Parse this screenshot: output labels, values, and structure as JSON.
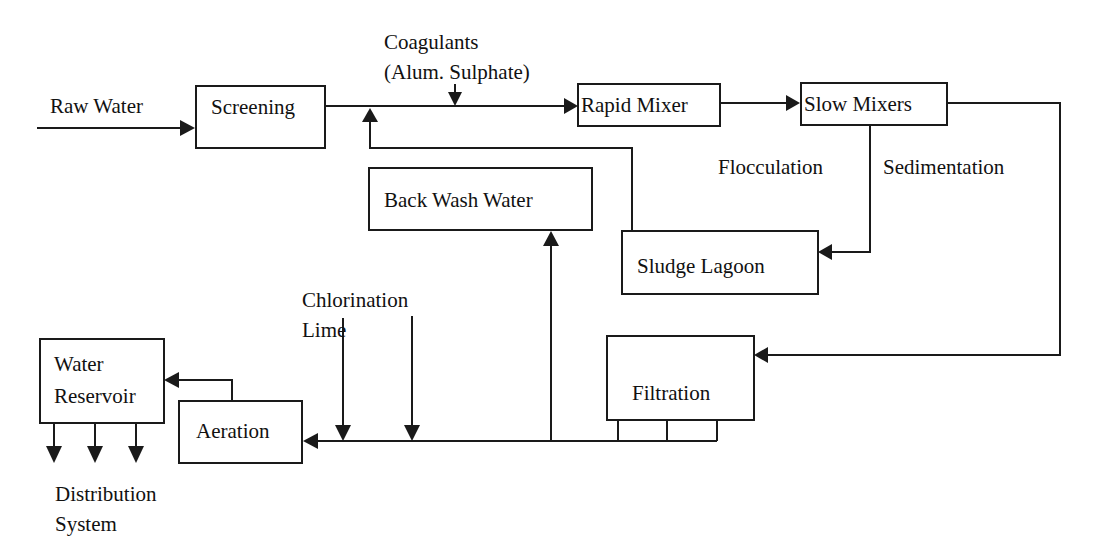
{
  "nodes": {
    "screening": "Screening",
    "rapid_mixer": "Rapid Mixer",
    "slow_mixers": "Slow Mixers",
    "back_wash_water": "Back Wash Water",
    "sludge_lagoon": "Sludge Lagoon",
    "filtration": "Filtration",
    "aeration": "Aeration",
    "water_reservoir_line1": "Water",
    "water_reservoir_line2": "Reservoir"
  },
  "labels": {
    "raw_water": "Raw Water",
    "coagulants_line1": "Coagulants",
    "coagulants_line2": "(Alum. Sulphate)",
    "flocculation": "Flocculation",
    "sedimentation": "Sedimentation",
    "chlorination": "Chlorination",
    "lime": "Lime",
    "distribution_line1": "Distribution",
    "distribution_line2": "System"
  },
  "edges": [
    {
      "from": "Raw Water",
      "to": "Screening"
    },
    {
      "from": "Screening",
      "to": "Rapid Mixer"
    },
    {
      "from": "Coagulants (Alum. Sulphate)",
      "to": "Screening-Rapid Mixer line"
    },
    {
      "from": "Rapid Mixer",
      "to": "Slow Mixers"
    },
    {
      "from": "Slow Mixers",
      "to": "Sludge Lagoon",
      "label": "Flocculation / Sedimentation"
    },
    {
      "from": "Slow Mixers",
      "to": "Filtration"
    },
    {
      "from": "Sludge Lagoon",
      "to": "Screening-Rapid Mixer line"
    },
    {
      "from": "Filtration",
      "to": "Back Wash Water"
    },
    {
      "from": "Filtration",
      "to": "Aeration"
    },
    {
      "from": "Chlorination",
      "to": "Filtration-Aeration line"
    },
    {
      "from": "Lime",
      "to": "Filtration-Aeration line"
    },
    {
      "from": "Aeration",
      "to": "Water Reservoir"
    },
    {
      "from": "Water Reservoir",
      "to": "Distribution System"
    }
  ],
  "colors": {
    "line": "#1a1a1a",
    "background": "#ffffff"
  }
}
